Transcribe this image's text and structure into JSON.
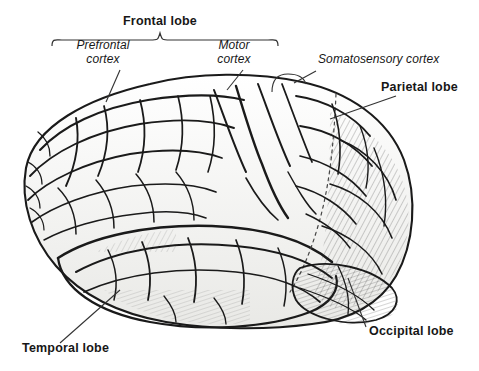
{
  "figure": {
    "style": "pen-and-ink line drawing, black on white",
    "background_color": "#ffffff",
    "ink_color": "#1a1a1a",
    "fill_color": "#f2f2f0"
  },
  "labels": {
    "frontal_lobe": {
      "text": "Frontal lobe",
      "style": "bold",
      "x": 160,
      "y": 22,
      "connector": "brace",
      "brace": {
        "left_x": 52,
        "right_x": 278,
        "y": 40,
        "tip_x": 160
      }
    },
    "prefrontal_cortex": {
      "line1": "Prefrontal",
      "line2": "cortex",
      "style": "italic",
      "x": 103,
      "y": 44,
      "leader": {
        "x1": 120,
        "y1": 70,
        "x2": 106,
        "y2": 102
      }
    },
    "motor_cortex": {
      "line1": "Motor",
      "line2": "cortex",
      "style": "italic",
      "x": 232,
      "y": 44,
      "leader": {
        "x1": 243,
        "y1": 70,
        "x2": 227,
        "y2": 90
      }
    },
    "somatosensory_cortex": {
      "text": "Somatosensory cortex",
      "style": "italic",
      "x": 318,
      "y": 58,
      "leader": {
        "x1": 315,
        "y1": 72,
        "x2": 292,
        "y2": 86
      },
      "bracket": {
        "x": 272,
        "y": 72,
        "w": 34,
        "h": 22
      }
    },
    "parietal_lobe": {
      "text": "Parietal lobe",
      "style": "bold",
      "x": 381,
      "y": 84,
      "leader": {
        "x1": 396,
        "y1": 96,
        "x2": 330,
        "y2": 119
      }
    },
    "occipital_lobe": {
      "text": "Occipital lobe",
      "style": "bold",
      "x": 370,
      "y": 330,
      "leader": {
        "x1": 366,
        "y1": 327,
        "x2": 348,
        "y2": 278
      }
    },
    "temporal_lobe": {
      "text": "Temporal lobe",
      "style": "bold",
      "x": 22,
      "y": 347,
      "leader": {
        "x1": 60,
        "y1": 343,
        "x2": 120,
        "y2": 290
      }
    }
  },
  "regions": [
    {
      "name": "frontal-lobe",
      "position": "upper-left"
    },
    {
      "name": "prefrontal-cortex",
      "position": "anterior-left"
    },
    {
      "name": "motor-cortex",
      "position": "superior-center"
    },
    {
      "name": "somatosensory-cortex",
      "position": "superior-right-of-center"
    },
    {
      "name": "parietal-lobe",
      "position": "upper-right"
    },
    {
      "name": "occipital-lobe",
      "position": "posterior-right"
    },
    {
      "name": "temporal-lobe",
      "position": "inferior-center"
    }
  ]
}
